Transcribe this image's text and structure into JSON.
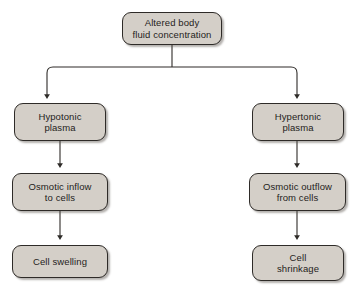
{
  "figure": {
    "caption": "",
    "colors": {
      "node_fill": "#d4cfc8",
      "node_border": "#2e2b28",
      "edge": "#2e2b28",
      "text": "#1f1d1b",
      "background": "#ffffff"
    }
  },
  "nodes": {
    "root": {
      "label": "Altered body\nfluid concentration"
    },
    "left_1": {
      "label": "Hypotonic\nplasma"
    },
    "left_2": {
      "label": "Osmotic inflow\nto cells"
    },
    "left_3": {
      "label": "Cell swelling"
    },
    "right_1": {
      "label": "Hypertonic\nplasma"
    },
    "right_2": {
      "label": "Osmotic outflow\nfrom cells"
    },
    "right_3": {
      "label": "Cell\nshrinkage"
    }
  }
}
